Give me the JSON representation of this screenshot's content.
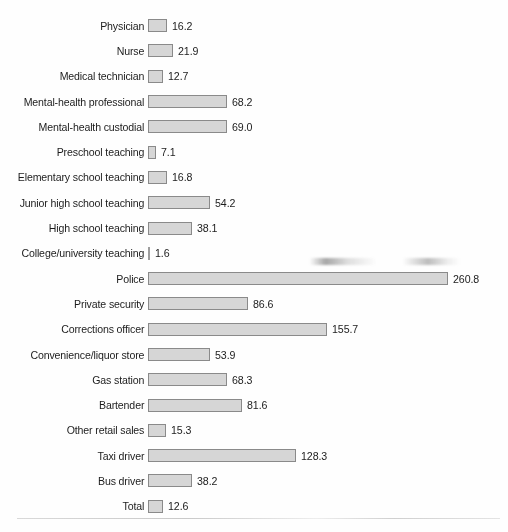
{
  "chart_data": {
    "type": "bar",
    "orientation": "horizontal",
    "title": "",
    "subtitle": "",
    "xlabel": "",
    "ylabel": "",
    "grid": false,
    "legend": null,
    "axis_visible": false,
    "value_labels": true,
    "xlim": [
      0,
      260.8
    ],
    "categories": [
      "Physician",
      "Nurse",
      "Medical technician",
      "Mental-health professional",
      "Mental-health custodial",
      "Preschool teaching",
      "Elementary school teaching",
      "Junior high school teaching",
      "High school teaching",
      "College/university teaching",
      "Police",
      "Private security",
      "Corrections officer",
      "Convenience/liquor store",
      "Gas station",
      "Bartender",
      "Other retail sales",
      "Taxi driver",
      "Bus driver",
      "Total"
    ],
    "values": [
      16.2,
      21.9,
      12.7,
      68.2,
      69.0,
      7.1,
      16.8,
      54.2,
      38.1,
      1.6,
      260.8,
      86.6,
      155.7,
      53.9,
      68.3,
      81.6,
      15.3,
      128.3,
      38.2,
      12.6
    ],
    "value_label_texts": [
      "16.2",
      "21.9",
      "12.7",
      "68.2",
      "69.0",
      "7.1",
      "16.8",
      "54.2",
      "38.1",
      "1.6",
      "260.8",
      "86.6",
      "155.7",
      "53.9",
      "68.3",
      "81.6",
      "15.3",
      "128.3",
      "38.2",
      "12.6"
    ],
    "colors": {
      "bar_fill": "#d6d6d6",
      "bar_border": "#8a8a8a",
      "text": "#1c1c1c",
      "background": "#ffffff",
      "rule": "#cccccc"
    }
  },
  "rows": [
    {
      "label": "Physician",
      "value": 16.2,
      "value_text": "16.2"
    },
    {
      "label": "Nurse",
      "value": 21.9,
      "value_text": "21.9"
    },
    {
      "label": "Medical technician",
      "value": 12.7,
      "value_text": "12.7"
    },
    {
      "label": "Mental-health professional",
      "value": 68.2,
      "value_text": "68.2"
    },
    {
      "label": "Mental-health custodial",
      "value": 69.0,
      "value_text": "69.0"
    },
    {
      "label": "Preschool teaching",
      "value": 7.1,
      "value_text": "7.1"
    },
    {
      "label": "Elementary school teaching",
      "value": 16.8,
      "value_text": "16.8"
    },
    {
      "label": "Junior high school teaching",
      "value": 54.2,
      "value_text": "54.2"
    },
    {
      "label": "High school teaching",
      "value": 38.1,
      "value_text": "38.1"
    },
    {
      "label": "College/university teaching",
      "value": 1.6,
      "value_text": "1.6"
    },
    {
      "label": "Police",
      "value": 260.8,
      "value_text": "260.8"
    },
    {
      "label": "Private security",
      "value": 86.6,
      "value_text": "86.6"
    },
    {
      "label": "Corrections officer",
      "value": 155.7,
      "value_text": "155.7"
    },
    {
      "label": "Convenience/liquor store",
      "value": 53.9,
      "value_text": "53.9"
    },
    {
      "label": "Gas station",
      "value": 68.3,
      "value_text": "68.3"
    },
    {
      "label": "Bartender",
      "value": 81.6,
      "value_text": "81.6"
    },
    {
      "label": "Other retail sales",
      "value": 15.3,
      "value_text": "15.3"
    },
    {
      "label": "Taxi driver",
      "value": 128.3,
      "value_text": "128.3"
    },
    {
      "label": "Bus driver",
      "value": 38.2,
      "value_text": "38.2"
    },
    {
      "label": "Total",
      "value": 12.6,
      "value_text": "12.6"
    }
  ]
}
